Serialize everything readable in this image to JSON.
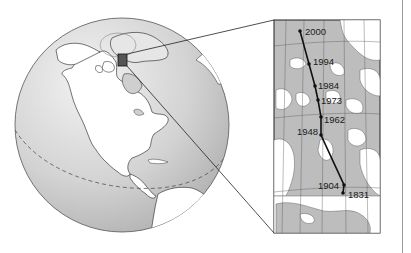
{
  "figure": {
    "colors": {
      "ocean": "#c9c9c9",
      "land": "#ffffff",
      "outline": "#3a3a3a",
      "path": "#111111",
      "inset_water": "#bdbdbd",
      "right_rule": "#9a9a9a"
    },
    "globe": {
      "center": [
        122,
        125
      ],
      "radius": 107,
      "equator_style": "dashed",
      "highlight_box": {
        "x": 118,
        "y": 54,
        "w": 9,
        "h": 12
      }
    },
    "inset": {
      "box": {
        "x": 274,
        "y": 20,
        "w": 106,
        "h": 213
      },
      "path_points": [
        {
          "year": "2000",
          "dot": [
            300,
            31
          ],
          "label": [
            305,
            34
          ]
        },
        {
          "year": "1994",
          "dot": [
            309,
            64
          ],
          "label": [
            313,
            64
          ]
        },
        {
          "year": "1984",
          "dot": [
            315,
            86
          ],
          "label": [
            318,
            88
          ]
        },
        {
          "year": "1973",
          "dot": [
            318,
            100
          ],
          "label": [
            321,
            104
          ]
        },
        {
          "year": "1962",
          "dot": [
            321,
            117
          ],
          "label": [
            324,
            123
          ]
        },
        {
          "year": "1948",
          "dot": [
            321,
            135
          ],
          "label": [
            297,
            134
          ]
        },
        {
          "year": "1904",
          "dot": [
            344,
            185
          ],
          "label": [
            318,
            188
          ]
        },
        {
          "year": "1831",
          "dot": [
            343,
            193
          ],
          "label": [
            348,
            198
          ]
        }
      ]
    }
  },
  "labels": {
    "y2000": "2000",
    "y1994": "1994",
    "y1984": "1984",
    "y1973": "1973",
    "y1962": "1962",
    "y1948": "1948",
    "y1904": "1904",
    "y1831": "1831"
  }
}
